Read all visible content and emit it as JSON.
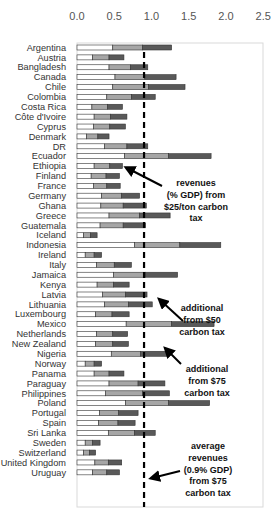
{
  "chart_data": {
    "type": "bar",
    "orientation": "horizontal",
    "stacked": true,
    "title": "",
    "xlabel": "",
    "ylabel": "",
    "xlim": [
      0,
      2.5
    ],
    "x_ticks": [
      "0.0",
      "0.5",
      "1.0",
      "1.5",
      "2.0",
      "2.5"
    ],
    "grid": false,
    "legend": null,
    "categories": [
      "Argentina",
      "Austria",
      "Bangladesh",
      "Canada",
      "Chile",
      "Colombia",
      "Costa Rica",
      "Côte d'Ivoire",
      "Cyprus",
      "Denmark",
      "DR",
      "Ecuador",
      "Ethiopia",
      "Finland",
      "France",
      "Germany",
      "Ghana",
      "Greece",
      "Guatemala",
      "Iceland",
      "Indonesia",
      "Ireland",
      "Italy",
      "Jamaica",
      "Kenya",
      "Latvia",
      "Lithuania",
      "Luxembourg",
      "Mexico",
      "Netherlands",
      "New Zealand",
      "Nigeria",
      "Norway",
      "Panama",
      "Paraguay",
      "Philippines",
      "Poland",
      "Portugal",
      "Spain",
      "Sri Lanka",
      "Sweden",
      "Switzerland",
      "United Kingdom",
      "Uruguay"
    ],
    "series": [
      {
        "name": "revenues (% GDP) from $25/ton carbon tax",
        "color": "#ffffff",
        "values": [
          0.48,
          0.21,
          0.43,
          0.51,
          0.48,
          0.4,
          0.2,
          0.23,
          0.22,
          0.13,
          0.37,
          0.64,
          0.23,
          0.19,
          0.22,
          0.33,
          0.32,
          0.43,
          0.31,
          0.09,
          0.77,
          0.11,
          0.26,
          0.49,
          0.27,
          0.34,
          0.37,
          0.25,
          0.66,
          0.26,
          0.25,
          0.46,
          0.11,
          0.23,
          0.43,
          0.38,
          0.65,
          0.3,
          0.29,
          0.42,
          0.11,
          0.09,
          0.24,
          0.21
        ]
      },
      {
        "name": "additional from $50 carbon tax",
        "color": "#a6a6a6",
        "values": [
          0.4,
          0.22,
          0.29,
          0.4,
          0.48,
          0.33,
          0.21,
          0.22,
          0.22,
          0.15,
          0.3,
          0.59,
          0.21,
          0.2,
          0.18,
          0.27,
          0.3,
          0.41,
          0.31,
          0.09,
          0.61,
          0.12,
          0.24,
          0.43,
          0.22,
          0.31,
          0.32,
          0.22,
          0.61,
          0.22,
          0.23,
          0.39,
          0.12,
          0.2,
          0.39,
          0.5,
          0.58,
          0.26,
          0.26,
          0.35,
          0.1,
          0.08,
          0.18,
          0.19
        ]
      },
      {
        "name": "additional from $75 carbon tax",
        "color": "#595959",
        "values": [
          0.39,
          0.2,
          0.23,
          0.42,
          0.49,
          0.32,
          0.2,
          0.22,
          0.21,
          0.15,
          0.28,
          0.57,
          0.17,
          0.18,
          0.18,
          0.24,
          0.31,
          0.41,
          0.3,
          0.09,
          0.55,
          0.1,
          0.23,
          0.43,
          0.21,
          0.29,
          0.32,
          0.23,
          0.57,
          0.2,
          0.21,
          0.37,
          0.1,
          0.2,
          0.36,
          0.36,
          0.55,
          0.26,
          0.23,
          0.28,
          0.1,
          0.08,
          0.18,
          0.17
        ]
      }
    ],
    "totals_at_75": [
      1.27,
      0.63,
      0.95,
      1.33,
      1.45,
      1.05,
      0.61,
      0.67,
      0.65,
      0.43,
      0.95,
      1.8,
      0.61,
      0.57,
      0.58,
      0.84,
      0.93,
      1.25,
      0.92,
      0.27,
      1.93,
      0.33,
      0.73,
      1.35,
      0.7,
      0.94,
      1.01,
      0.7,
      1.84,
      0.68,
      0.69,
      1.22,
      0.33,
      0.63,
      1.18,
      1.24,
      1.78,
      0.82,
      0.78,
      1.05,
      0.31,
      0.25,
      0.6,
      0.57
    ],
    "reference_line": {
      "value": 0.9,
      "style": "dashed",
      "color": "#000000",
      "label": "average revenues (0.9% GDP) from $75 carbon tax"
    },
    "annotations": [
      {
        "lines": [
          "revenues",
          "(% GDP) from",
          "$25/ton carbon",
          "tax"
        ],
        "points_to": "white segment ($25/ton)"
      },
      {
        "lines": [
          "additional",
          "from $50",
          "carbon tax"
        ],
        "points_to": "light grey segment"
      },
      {
        "lines": [
          "additional",
          "from $75",
          "carbon tax"
        ],
        "points_to": "dark grey segment"
      },
      {
        "lines": [
          "average",
          "revenues",
          "(0.9% GDP)",
          "from $75",
          "carbon tax"
        ],
        "points_to": "dashed average line"
      }
    ]
  },
  "colors": {
    "seg25": "#ffffff",
    "seg50": "#a6a6a6",
    "seg75": "#595959",
    "outline": "#333333",
    "frame": "#d9d9d9"
  }
}
